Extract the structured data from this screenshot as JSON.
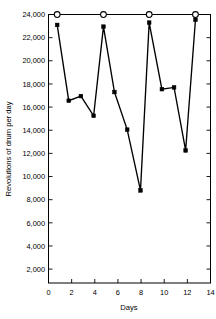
{
  "chart_data": {
    "type": "line",
    "title": "",
    "xlabel": "Days",
    "ylabel": "Revolutions of drum per day",
    "xlim": [
      0,
      14
    ],
    "ylim": [
      800,
      24000
    ],
    "grid": false,
    "legend": null,
    "xticks": [
      0,
      2,
      4,
      6,
      8,
      10,
      12,
      14
    ],
    "xtick_labels": [
      "0",
      "2",
      "4",
      "6",
      "8",
      "10",
      "12",
      "14"
    ],
    "yticks": [
      2000,
      4000,
      6000,
      8000,
      10000,
      12000,
      14000,
      16000,
      18000,
      20000,
      22000,
      24000
    ],
    "ytick_labels": [
      "2,000",
      "4,000",
      "6,000",
      "8,000",
      "10,000",
      "12,000",
      "14,000",
      "16,000",
      "18,000",
      "20,000",
      "22,000",
      "24,000"
    ],
    "series": [
      {
        "name": "Revolutions of drum per day",
        "marker": "filled-square",
        "x": [
          0.75,
          1.75,
          2.8,
          3.9,
          4.75,
          5.7,
          6.8,
          7.95,
          8.7,
          9.8,
          10.85,
          11.85,
          12.7
        ],
        "values": [
          23100,
          16550,
          16950,
          15250,
          22950,
          17300,
          14050,
          8800,
          23300,
          17550,
          17700,
          12250,
          23550
        ]
      },
      {
        "name": "Upper open-circle markers",
        "marker": "open-circle",
        "x": [
          0.75,
          4.75,
          8.7,
          12.7
        ],
        "values": [
          24000,
          24000,
          24000,
          24000
        ]
      }
    ],
    "annotations": []
  },
  "figure": {
    "axis_color": "#000000",
    "line_color": "#000000",
    "background": "#ffffff"
  }
}
